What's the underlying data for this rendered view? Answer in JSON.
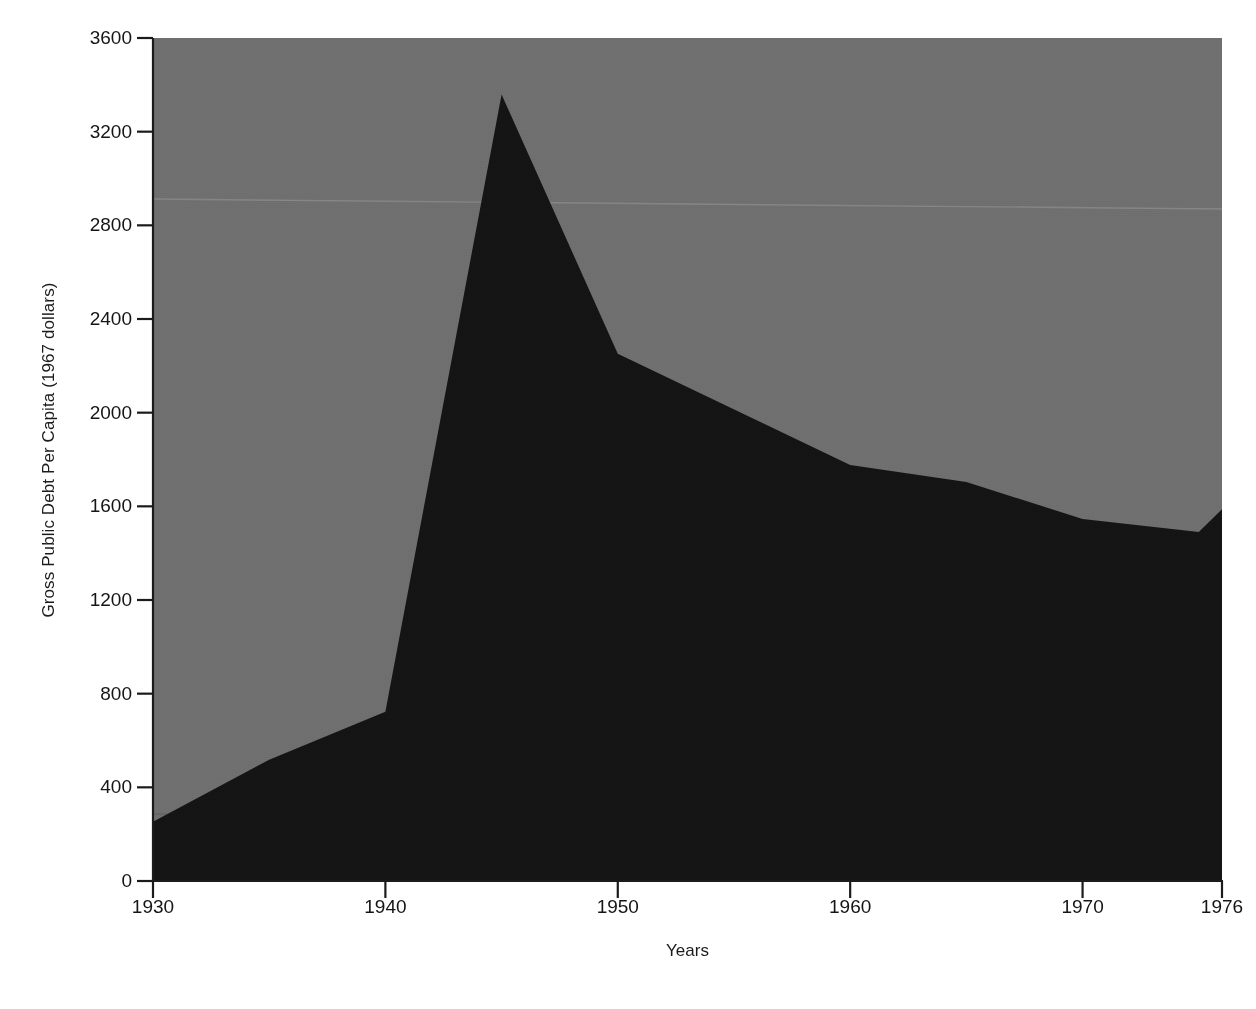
{
  "chart_data": {
    "type": "area",
    "title": "",
    "subtitle": "",
    "xlabel": "Years",
    "ylabel": "Gross Public Debt Per Capita (1967 dollars)",
    "x": [
      1930,
      1935,
      1940,
      1945,
      1950,
      1960,
      1965,
      1970,
      1975,
      1976
    ],
    "values": [
      253,
      518,
      723,
      3359,
      2252,
      1777,
      1704,
      1546,
      1490,
      1588
    ],
    "series": [
      {
        "name": "Gross Public Debt Per Capita",
        "values": [
          253,
          518,
          723,
          3359,
          2252,
          1777,
          1704,
          1546,
          1490,
          1588
        ]
      }
    ],
    "xlim": [
      1930,
      1976
    ],
    "ylim": [
      0,
      3600
    ],
    "xticks": [
      1930,
      1940,
      1950,
      1960,
      1970,
      1976
    ],
    "xtick_labels": [
      "1930",
      "1940",
      "1950",
      "1960",
      "1970",
      "1976"
    ],
    "yticks": [
      0,
      400,
      800,
      1200,
      1600,
      2000,
      2400,
      2800,
      3200,
      3600
    ],
    "ytick_labels": [
      "0",
      "400",
      "800",
      "1200",
      "1600",
      "2000",
      "2400",
      "2800",
      "3200",
      "3600"
    ],
    "grid": false,
    "legend": false,
    "legend_position": "none",
    "colors": {
      "area_fill": "#141414",
      "plot_background": "#6f6f6f",
      "axis": "#1b1b1b",
      "text": "#151515",
      "page_background": "#ffffff"
    }
  }
}
